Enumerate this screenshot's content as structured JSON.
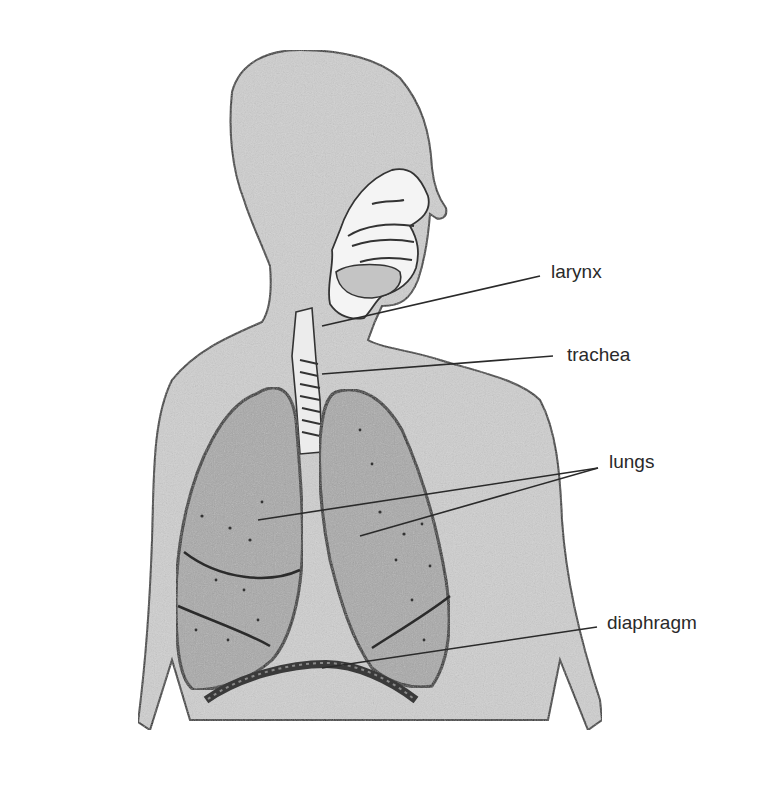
{
  "diagram": {
    "labels": [
      {
        "id": "larynx",
        "text": "larynx",
        "x": 551,
        "y": 262
      },
      {
        "id": "trachea",
        "text": "trachea",
        "x": 567,
        "y": 345
      },
      {
        "id": "lungs",
        "text": "lungs",
        "x": 609,
        "y": 452
      },
      {
        "id": "diaphragm",
        "text": "diaphragm",
        "x": 607,
        "y": 613
      }
    ],
    "leaders": [
      {
        "label": "larynx",
        "points": [
          [
            540,
            276
          ],
          [
            322,
            326
          ]
        ]
      },
      {
        "label": "trachea",
        "points": [
          [
            553,
            356
          ],
          [
            322,
            374
          ]
        ]
      },
      {
        "label": "lungs",
        "points": [
          [
            598,
            468
          ],
          [
            258,
            520
          ]
        ]
      },
      {
        "label": "lungs",
        "points": [
          [
            598,
            468
          ],
          [
            360,
            536
          ]
        ]
      },
      {
        "label": "diaphragm",
        "points": [
          [
            597,
            627
          ],
          [
            322,
            668
          ]
        ]
      }
    ],
    "colors": {
      "skin_fill": "#cfcfcf",
      "lung_fill": "#a9a9a9",
      "outline": "#333333",
      "leader": "#2a2a2a",
      "background": "#ffffff"
    }
  }
}
